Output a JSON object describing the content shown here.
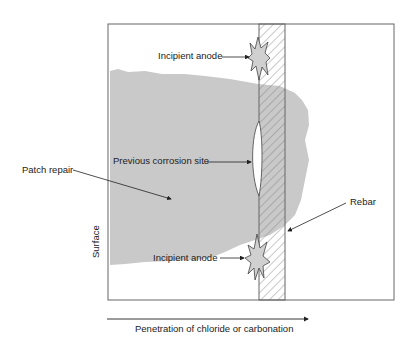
{
  "diagram": {
    "labels": {
      "incipient_anode_top": "Incipient anode",
      "previous_corrosion_site": "Previous corrosion site",
      "patch_repair": "Patch repair",
      "rebar": "Rebar",
      "surface": "Surface",
      "incipient_anode_bottom": "Incipient anode",
      "penetration_axis": "Penetration of chloride or carbonation"
    },
    "colors": {
      "patch_fill": "#c8c8c8",
      "outline": "#555555",
      "anode_fill": "#d0d0d0",
      "text": "#222222"
    }
  }
}
